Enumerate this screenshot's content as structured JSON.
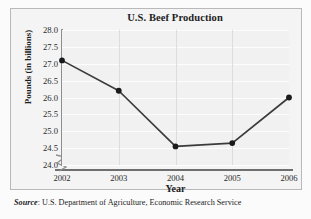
{
  "chart_data": {
    "type": "line",
    "title": "U.S. Beef Production",
    "xlabel": "Year",
    "ylabel": "Pounds (in billions)",
    "categories": [
      "2002",
      "2003",
      "2004",
      "2005",
      "2006"
    ],
    "values": [
      27.1,
      26.2,
      24.55,
      24.65,
      26.0
    ],
    "series": [
      {
        "name": "U.S. Beef Production",
        "values": [
          27.1,
          26.2,
          24.55,
          24.65,
          26.0
        ]
      }
    ],
    "ylim": [
      24.0,
      28.0
    ],
    "yticks": [
      "28.0",
      "27.5",
      "27.0",
      "26.5",
      "26.0",
      "25.5",
      "25.0",
      "24.5",
      "24.0"
    ],
    "ytick_values": [
      28.0,
      27.5,
      27.0,
      26.5,
      26.0,
      25.5,
      25.0,
      24.5,
      24.0
    ],
    "xticks": [
      "2002",
      "2003",
      "2004",
      "2005",
      "2006"
    ],
    "grid": "horizontal-and-vertical",
    "legend": "none",
    "axis_break": "y-axis-break-at-origin",
    "marker": "filled-circle",
    "line_color": "#3b3b3b",
    "marker_color": "#1a1a1a",
    "plot_background": "#f1f1f1",
    "gridline_color": "#dcdcdc"
  },
  "source_note": {
    "lead": "Source",
    "text": ": U.S. Department of Agriculture, Economic Research Service"
  }
}
